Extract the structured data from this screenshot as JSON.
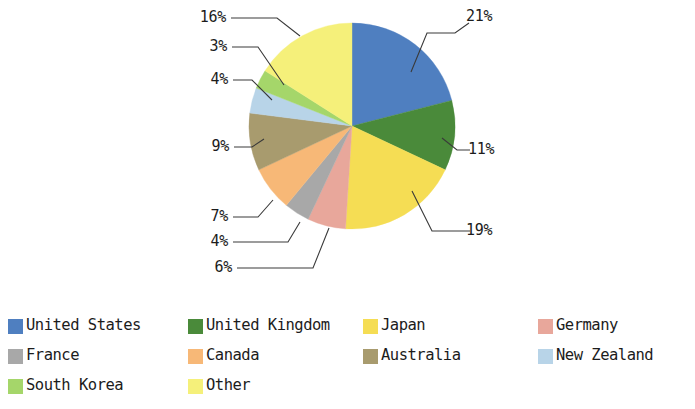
{
  "chart_data": {
    "type": "pie",
    "title": "",
    "subtitle": "",
    "xlabel": "",
    "ylabel": "",
    "grid": false,
    "legend_position": "bottom",
    "value_unit": "%",
    "start_angle_deg": 0,
    "direction": "clockwise",
    "categories": [
      "United States",
      "United Kingdom",
      "Japan",
      "Germany",
      "France",
      "Canada",
      "Australia",
      "New Zealand",
      "South Korea",
      "Other"
    ],
    "values": [
      21,
      11,
      19,
      6,
      4,
      7,
      9,
      4,
      3,
      16
    ],
    "data_labels": [
      "21%",
      "11%",
      "19%",
      "6%",
      "4%",
      "7%",
      "9%",
      "4%",
      "3%",
      "16%"
    ],
    "colors": [
      "#4f7fc0",
      "#4a8a3a",
      "#f5dd54",
      "#e8a79b",
      "#a8a8a8",
      "#f7b877",
      "#a89b6e",
      "#b8d4e8",
      "#a5d66a",
      "#f5f07a"
    ],
    "slices": [
      {
        "label": "United States",
        "value": 21,
        "display": "21%",
        "color": "#4f7fc0"
      },
      {
        "label": "United Kingdom",
        "value": 11,
        "display": "11%",
        "color": "#4a8a3a"
      },
      {
        "label": "Japan",
        "value": 19,
        "display": "19%",
        "color": "#f5dd54"
      },
      {
        "label": "Germany",
        "value": 6,
        "display": "6%",
        "color": "#e8a79b"
      },
      {
        "label": "France",
        "value": 4,
        "display": "4%",
        "color": "#a8a8a8"
      },
      {
        "label": "Canada",
        "value": 7,
        "display": "7%",
        "color": "#f7b877"
      },
      {
        "label": "Australia",
        "value": 9,
        "display": "9%",
        "color": "#a89b6e"
      },
      {
        "label": "New Zealand",
        "value": 4,
        "display": "4%",
        "color": "#b8d4e8"
      },
      {
        "label": "South Korea",
        "value": 3,
        "display": "3%",
        "color": "#a5d66a"
      },
      {
        "label": "Other",
        "value": 16,
        "display": "16%",
        "color": "#f5f07a"
      }
    ]
  },
  "pie_labels": {
    "united_states": "21%",
    "united_kingdom": "11%",
    "japan": "19%",
    "germany": "6%",
    "france": "4%",
    "canada": "7%",
    "australia": "9%",
    "new_zealand": "4%",
    "south_korea": "3%",
    "other": "16%"
  },
  "legend": {
    "rows": [
      [
        {
          "label": "United States",
          "color": "#4f7fc0"
        },
        {
          "label": "United Kingdom",
          "color": "#4a8a3a"
        },
        {
          "label": "Japan",
          "color": "#f5dd54"
        },
        {
          "label": "Germany",
          "color": "#e8a79b"
        }
      ],
      [
        {
          "label": "France",
          "color": "#a8a8a8"
        },
        {
          "label": "Canada",
          "color": "#f7b877"
        },
        {
          "label": "Australia",
          "color": "#a89b6e"
        },
        {
          "label": "New Zealand",
          "color": "#b8d4e8"
        }
      ],
      [
        {
          "label": "South Korea",
          "color": "#a5d66a"
        },
        {
          "label": "Other",
          "color": "#f5f07a"
        }
      ]
    ]
  }
}
